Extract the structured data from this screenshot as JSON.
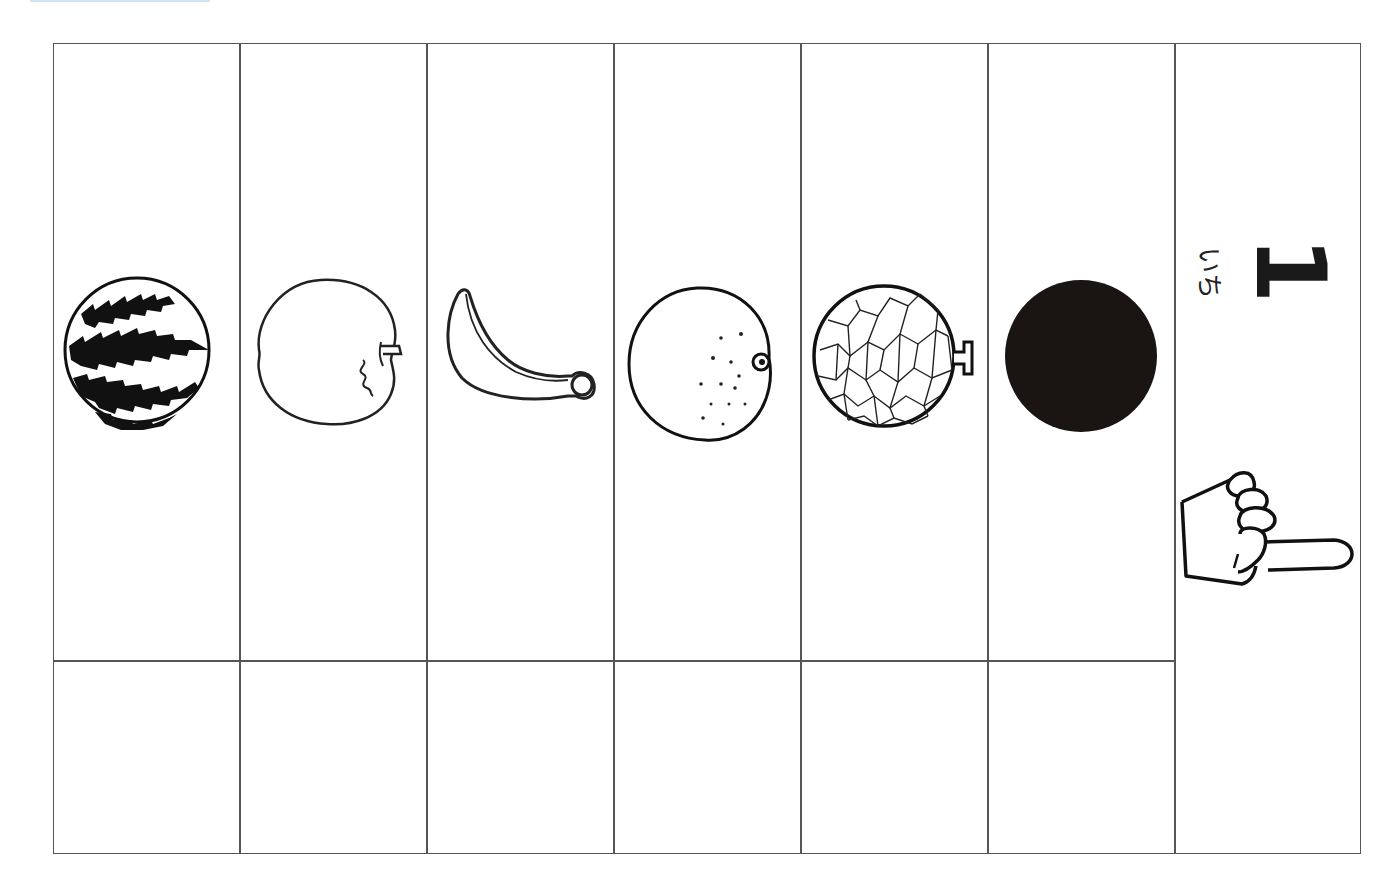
{
  "worksheet": {
    "number": {
      "digit": "1",
      "reading": "いち"
    },
    "fruits": [
      {
        "name": "watermelon",
        "style": "striped"
      },
      {
        "name": "apple",
        "style": "outline"
      },
      {
        "name": "banana",
        "style": "outline"
      },
      {
        "name": "orange",
        "style": "dotted"
      },
      {
        "name": "melon",
        "style": "netted"
      },
      {
        "name": "black-circle",
        "style": "filled"
      }
    ],
    "answer_boxes": [
      "",
      "",
      "",
      "",
      "",
      ""
    ],
    "pointer": {
      "icon": "pointing-hand-icon",
      "direction": "left"
    }
  },
  "colors": {
    "line": "#555555",
    "ink": "#1a1a1a",
    "background": "#ffffff",
    "top_accent": "#cfe3f2"
  }
}
